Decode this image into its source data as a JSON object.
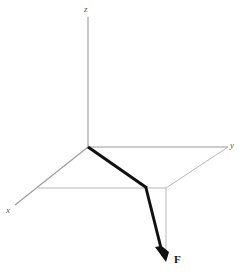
{
  "figure": {
    "background_color": "#ffffff"
  },
  "axes": {
    "line_color": "#9a9a9a",
    "line_width": 1,
    "labels": {
      "z": "z",
      "y": "y",
      "x": "x"
    },
    "origin": {
      "x": 88,
      "y": 147
    },
    "z_axis": {
      "x1": 88,
      "y1": 17,
      "x2": 88,
      "y2": 147
    },
    "y_axis": {
      "x1": 88,
      "y1": 147,
      "x2": 228,
      "y2": 147
    },
    "x_axis": {
      "x1": 88,
      "y1": 147,
      "x2": 15,
      "y2": 205
    }
  },
  "projection": {
    "line_color": "#b5b5b5",
    "line_width": 1,
    "base_horizontal": {
      "x1": 38,
      "y1": 188,
      "x2": 166,
      "y2": 188
    },
    "base_diagonal": {
      "x1": 166,
      "y1": 188,
      "x2": 228,
      "y2": 147
    },
    "drop_line": {
      "x1": 166,
      "y1": 188,
      "x2": 166,
      "y2": 258
    }
  },
  "force_vector": {
    "label": "F",
    "color": "#111111",
    "line_width": 3,
    "start": {
      "x": 88,
      "y": 147
    },
    "plane_crossing": {
      "x": 147,
      "y": 188
    },
    "tip": {
      "x": 166,
      "y": 261
    },
    "arrowhead_length": 13,
    "arrowhead_width": 8
  }
}
